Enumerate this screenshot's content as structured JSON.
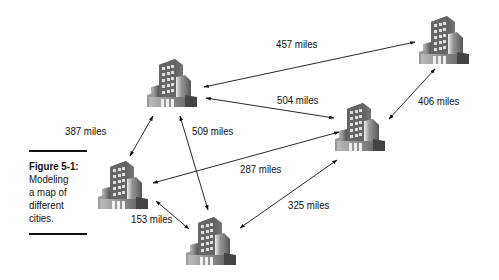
{
  "caption": {
    "title": "Figure 5-1:",
    "lines": [
      "Modeling",
      "a map of",
      "different",
      "cities."
    ]
  },
  "cities": [
    {
      "id": "A",
      "icon": "building-icon",
      "x": 145,
      "y": 55
    },
    {
      "id": "B",
      "icon": "building-icon",
      "x": 417,
      "y": 12
    },
    {
      "id": "C",
      "icon": "building-icon",
      "x": 333,
      "y": 99
    },
    {
      "id": "D",
      "icon": "building-icon",
      "x": 96,
      "y": 157
    },
    {
      "id": "E",
      "icon": "building-icon",
      "x": 184,
      "y": 213
    }
  ],
  "edges": [
    {
      "from": "A",
      "to": "B",
      "label": "457 miles"
    },
    {
      "from": "A",
      "to": "C",
      "label": "504 miles"
    },
    {
      "from": "B",
      "to": "C",
      "label": "406 miles"
    },
    {
      "from": "A",
      "to": "D",
      "label": "387 miles"
    },
    {
      "from": "A",
      "to": "E",
      "label": "509 miles"
    },
    {
      "from": "D",
      "to": "C",
      "label": "287 miles"
    },
    {
      "from": "D",
      "to": "E",
      "label": "153 miles"
    },
    {
      "from": "E",
      "to": "C",
      "label": "325 miles"
    }
  ]
}
